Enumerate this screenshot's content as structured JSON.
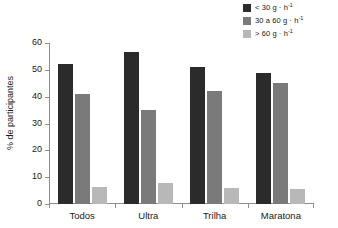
{
  "chart_data": {
    "type": "bar",
    "title": "",
    "xlabel": "",
    "ylabel": "% de participantes",
    "ylim": [
      0,
      60
    ],
    "yticks": [
      0,
      10,
      20,
      30,
      40,
      50,
      60
    ],
    "grid": false,
    "legend_position": "top-right",
    "categories": [
      "Todos",
      "Ultra",
      "Trilha",
      "Maratona"
    ],
    "series": [
      {
        "name": "< 30 g · h",
        "name_exponent": "-1",
        "color": "#2b2b2b",
        "values": [
          52,
          56.5,
          51,
          49
        ]
      },
      {
        "name": "30 a 60 g · h",
        "name_exponent": "-1",
        "color": "#7a7a7a",
        "values": [
          41,
          35,
          42,
          45
        ]
      },
      {
        "name": "> 60 g · h",
        "name_exponent": "-1",
        "color": "#b8b8b8",
        "values": [
          6.5,
          8,
          6,
          5.5
        ]
      }
    ]
  }
}
